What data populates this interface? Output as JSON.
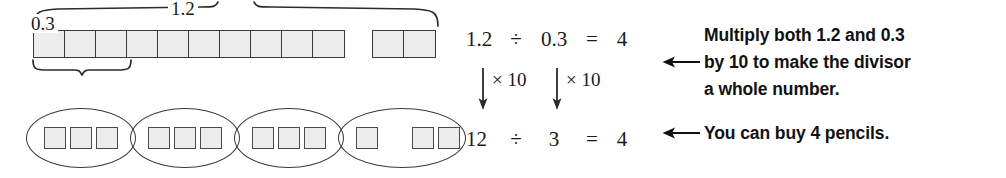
{
  "diagram": {
    "title_hidden": "Decimal division model 1.2 divided by 0.3",
    "top_model": {
      "whole_label": "1.2",
      "group_label": "0.3",
      "main_strip_cells": 10,
      "extra_strip_cells": 2,
      "total_cells": 12,
      "cell_fill": "#ececec",
      "cell_border": "#3a3a3a"
    },
    "bottom_model": {
      "groups": [
        {
          "squares": 3,
          "gap_after_first": false
        },
        {
          "squares": 3,
          "gap_after_first": false
        },
        {
          "squares": 3,
          "gap_after_first": false
        },
        {
          "squares": 3,
          "gap_after_first": true
        }
      ],
      "group_count": 4,
      "oval_border": "#3a3a3a",
      "square_fill": "#ececec"
    }
  },
  "equations": {
    "top": {
      "dividend": "1.2",
      "divide_sign": "÷",
      "divisor": "0.3",
      "equals_sign": "=",
      "quotient": "4"
    },
    "bottom": {
      "dividend": "12",
      "divide_sign": "÷",
      "divisor": "3",
      "equals_sign": "=",
      "quotient": "4"
    },
    "multiplier_left": "× 10",
    "multiplier_right": "× 10"
  },
  "explanation": {
    "note_1_lines": [
      "Multiply both 1.2 and 0.3",
      "by 10 to make the divisor",
      "a whole number."
    ],
    "note_2_lines": [
      "You can buy 4 pencils."
    ],
    "arrow_glyph": "←"
  }
}
